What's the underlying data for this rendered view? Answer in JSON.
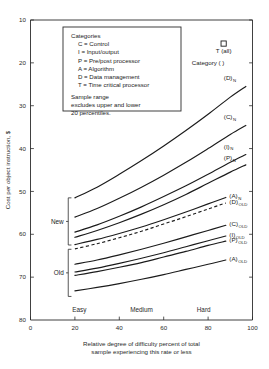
{
  "chart_data": {
    "type": "line",
    "title": "",
    "xlabel": "Relative degree of difficulty  percent of total sample experiencing this rate or less",
    "xlabel_line1": "Relative degree of difficulty   percent of total",
    "xlabel_line2": "sample experiencing this rate or less",
    "ylabel": "Cost per object instruction, $",
    "xlim": [
      0,
      100
    ],
    "ylim": [
      10,
      80
    ],
    "xticks": [
      0,
      20,
      40,
      60,
      80,
      100
    ],
    "yticks": [
      10,
      20,
      30,
      40,
      50,
      60,
      70,
      80
    ],
    "grid": false,
    "legend_position": "inside-top-left",
    "x_band_labels": [
      {
        "label": "Easy",
        "x": 22
      },
      {
        "label": "Medium",
        "x": 50
      },
      {
        "label": "Hard",
        "x": 78
      }
    ],
    "group_brackets": [
      {
        "label": "New",
        "y_top": 38.5,
        "y_bottom": 27.5
      },
      {
        "label": "Old",
        "y_top": 26.5,
        "y_bottom": 15.5
      }
    ],
    "point_markers": [
      {
        "label": "T (all)",
        "x": 87,
        "y": 74.5,
        "shape": "square"
      }
    ],
    "annotations": [
      {
        "text": "Category ( )",
        "x": 80,
        "y": 69.5
      }
    ],
    "series": [
      {
        "name": "(D)",
        "subscript": "N",
        "style": "solid",
        "x": [
          20,
          30,
          40,
          50,
          60,
          70,
          80,
          90,
          97
        ],
        "y": [
          38.5,
          41.0,
          44.0,
          47.2,
          50.6,
          54.2,
          58.0,
          62.0,
          64.5
        ]
      },
      {
        "name": "(C)",
        "subscript": "N",
        "style": "solid",
        "x": [
          20,
          30,
          40,
          50,
          60,
          70,
          80,
          90,
          97
        ],
        "y": [
          34.0,
          36.0,
          38.4,
          41.0,
          43.8,
          46.8,
          50.0,
          53.3,
          55.4
        ]
      },
      {
        "name": "(I)",
        "subscript": "N",
        "style": "solid",
        "x": [
          20,
          30,
          40,
          50,
          60,
          70,
          80,
          90,
          97
        ],
        "y": [
          30.5,
          32.2,
          34.2,
          36.4,
          38.8,
          41.3,
          44.0,
          46.8,
          48.6
        ]
      },
      {
        "name": "(P)",
        "subscript": "N",
        "style": "solid",
        "x": [
          20,
          30,
          40,
          50,
          60,
          70,
          80,
          90,
          97
        ],
        "y": [
          29.3,
          30.9,
          32.7,
          34.7,
          36.9,
          39.3,
          41.9,
          44.5,
          46.2
        ]
      },
      {
        "name": "(A)",
        "subscript": "N",
        "style": "solid",
        "x": [
          20,
          30,
          40,
          50,
          60,
          70,
          80,
          88
        ],
        "y": [
          27.6,
          28.8,
          30.2,
          31.7,
          33.4,
          35.2,
          37.1,
          38.6
        ]
      },
      {
        "name": "(D)",
        "subscript": "OLD",
        "style": "dashed",
        "x": [
          20,
          30,
          40,
          50,
          60,
          70,
          80,
          88
        ],
        "y": [
          26.6,
          27.8,
          29.2,
          30.7,
          32.4,
          34.1,
          35.9,
          37.3
        ]
      },
      {
        "name": "(C)",
        "subscript": "OLD",
        "style": "solid",
        "x": [
          20,
          30,
          40,
          50,
          60,
          70,
          80,
          88
        ],
        "y": [
          23.0,
          24.0,
          25.2,
          26.5,
          27.9,
          29.4,
          30.9,
          32.1
        ]
      },
      {
        "name": "(I)",
        "subscript": "OLD",
        "style": "solid",
        "x": [
          20,
          30,
          40,
          50,
          60,
          70,
          80,
          88
        ],
        "y": [
          21.2,
          22.1,
          23.2,
          24.4,
          25.7,
          27.1,
          28.5,
          29.6
        ]
      },
      {
        "name": "(P)",
        "subscript": "OLD",
        "style": "solid",
        "x": [
          20,
          30,
          40,
          50,
          60,
          70,
          80,
          88
        ],
        "y": [
          20.4,
          21.3,
          22.3,
          23.4,
          24.7,
          26.0,
          27.4,
          28.4
        ]
      },
      {
        "name": "(A)",
        "subscript": "OLD",
        "style": "solid",
        "x": [
          20,
          30,
          40,
          50,
          60,
          70,
          80,
          88
        ],
        "y": [
          16.8,
          17.6,
          18.5,
          19.5,
          20.6,
          21.8,
          23.0,
          24.0
        ]
      }
    ]
  },
  "legend": {
    "heading": "Categories",
    "entries": [
      "C = Control",
      "I = Input/output",
      "P = Pre/post processor",
      "A = Algorithm",
      "D = Data management",
      "T = Time critical processor"
    ],
    "note_lines": [
      "Sample range",
      "excludes upper and lower",
      "20 percentiles."
    ]
  },
  "axis": {
    "y_title": "Cost per object instruction, $",
    "x_caption_line1": "Relative degree of difficulty   percent of total",
    "x_caption_line2": "sample experiencing this rate or less",
    "y_tick_labels": [
      "80",
      "70",
      "60",
      "50",
      "40",
      "30",
      "20",
      "10"
    ],
    "x_tick_labels": [
      "0",
      "20",
      "40",
      "60",
      "80",
      "100"
    ]
  },
  "curve_labels": [
    {
      "base": "(D)",
      "sub": "N"
    },
    {
      "base": "(C)",
      "sub": "N"
    },
    {
      "base": "(I)",
      "sub": "N"
    },
    {
      "base": "(P)",
      "sub": "N"
    },
    {
      "base": "(A)",
      "sub": "N"
    },
    {
      "base": "(D)",
      "sub": "OLD"
    },
    {
      "base": "(C)",
      "sub": "OLD"
    },
    {
      "base": "(I)",
      "sub": "OLD"
    },
    {
      "base": "(P)",
      "sub": "OLD"
    },
    {
      "base": "(A)",
      "sub": "OLD"
    }
  ],
  "markers": {
    "t_all_label": "T (all)",
    "category_label": "Category ( )"
  },
  "brackets": {
    "new_label": "New",
    "old_label": "Old"
  },
  "bands": {
    "easy": "Easy",
    "medium": "Medium",
    "hard": "Hard"
  }
}
